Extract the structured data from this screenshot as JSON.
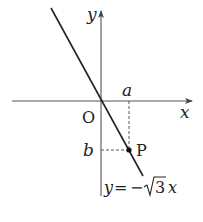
{
  "figure": {
    "type": "coordinate-plane",
    "axes": {
      "x_label": "x",
      "y_label": "y",
      "origin_label": "O"
    },
    "line": {
      "equation_lhs": "y",
      "equation_eq": "=",
      "equation_neg": "−",
      "equation_sqrt_arg": "3",
      "equation_var": "x",
      "equation_full": "y = −√3 x",
      "slope": "-sqrt(3)"
    },
    "point": {
      "label": "P",
      "x_coord_label": "a",
      "y_coord_label": "b"
    },
    "colors": {
      "stroke": "#222222",
      "axis": "#555555",
      "background": "#ffffff"
    }
  }
}
